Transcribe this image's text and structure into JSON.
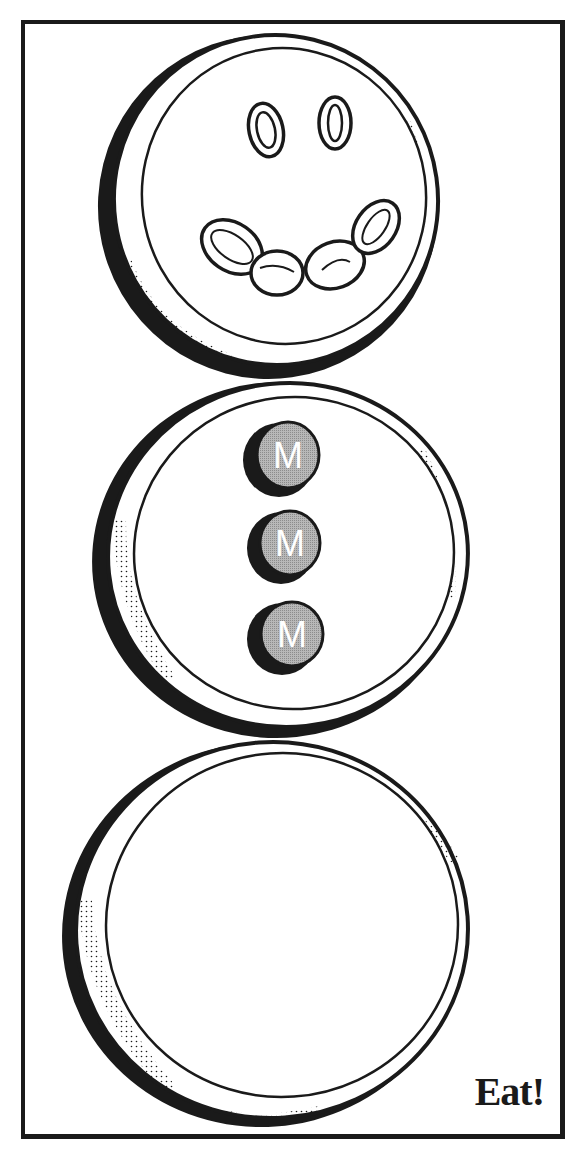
{
  "illustration": {
    "subject": "snowman made of three stacked cookies",
    "caption": "Eat!",
    "candy_letter": "M",
    "candies": [
      {
        "letter": "M",
        "color": "#a9a9a9"
      },
      {
        "letter": "M",
        "color": "#a9a9a9"
      },
      {
        "letter": "M",
        "color": "#a9a9a9"
      }
    ],
    "colors": {
      "ink": "#1a1a1a",
      "background": "#ffffff",
      "candy_fill": "#a9a9a9"
    },
    "cookies": [
      {
        "name": "head",
        "features": [
          "raisin eyes",
          "raisin smile"
        ]
      },
      {
        "name": "body",
        "features": [
          "three M candies"
        ]
      },
      {
        "name": "base",
        "features": []
      }
    ]
  }
}
